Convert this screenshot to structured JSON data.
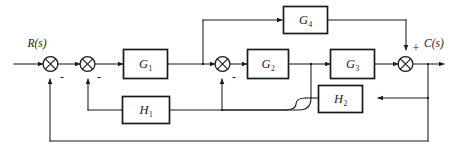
{
  "diagram": {
    "type": "block-diagram",
    "signals": {
      "input": "R(s)",
      "output": "C(s)"
    },
    "blocks": [
      {
        "id": "G1",
        "base": "G",
        "sub": "1",
        "role": "forward-path-block-1"
      },
      {
        "id": "G2",
        "base": "G",
        "sub": "2",
        "role": "forward-path-block-2"
      },
      {
        "id": "G3",
        "base": "G",
        "sub": "3",
        "role": "forward-path-block-3"
      },
      {
        "id": "G4",
        "base": "G",
        "sub": "4",
        "role": "feedforward-block"
      },
      {
        "id": "H1",
        "base": "H",
        "sub": "1",
        "role": "feedback-block-1"
      },
      {
        "id": "H2",
        "base": "H",
        "sub": "2",
        "role": "feedback-block-2"
      }
    ],
    "summing_junctions": [
      {
        "id": "S1",
        "signs": [
          "-"
        ],
        "role": "outer-loop-summer"
      },
      {
        "id": "S2",
        "signs": [
          "-"
        ],
        "role": "h1-loop-summer"
      },
      {
        "id": "S3",
        "signs": [
          "-"
        ],
        "role": "inner-loop-summer"
      },
      {
        "id": "S4",
        "signs": [
          "+"
        ],
        "role": "output-summer"
      }
    ],
    "signs": {
      "minus": "-",
      "plus": "+"
    },
    "colors": {
      "line": "#1a1a1a",
      "background": "#ffffff",
      "block_fill": "#ffffff"
    }
  }
}
